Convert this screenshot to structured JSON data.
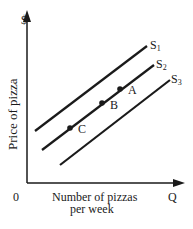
{
  "chart_data": {
    "type": "line",
    "title": "",
    "xlabel": "Number of pizzas per week",
    "xlabel_lines": [
      "Number of pizzas",
      "per week"
    ],
    "ylabel": "Price of pizza",
    "x_axis_end_label": "Q",
    "y_axis_end_label": "$",
    "origin_label": "0",
    "grid": false,
    "legend": "inline labels at line ends",
    "series": [
      {
        "name": "S1",
        "label_main": "S",
        "label_sub": "1",
        "x": [
          35,
          147
        ],
        "y": [
          131,
          46
        ]
      },
      {
        "name": "S2",
        "label_main": "S",
        "label_sub": "2",
        "x": [
          42,
          154
        ],
        "y": [
          150,
          65
        ]
      },
      {
        "name": "S3",
        "label_main": "S",
        "label_sub": "3",
        "x": [
          60,
          170
        ],
        "y": [
          165,
          80
        ]
      }
    ],
    "points": [
      {
        "label": "A",
        "curve": "S2",
        "x": 120,
        "y": 89
      },
      {
        "label": "B",
        "curve": "S2",
        "x": 102,
        "y": 103
      },
      {
        "label": "C",
        "curve": "S2",
        "x": 70,
        "y": 128
      }
    ],
    "note": "Coordinates are pixel positions; diagram is qualitative (no numeric ticks)."
  },
  "colors": {
    "ink": "#1a1a1a",
    "background": "#ffffff"
  }
}
